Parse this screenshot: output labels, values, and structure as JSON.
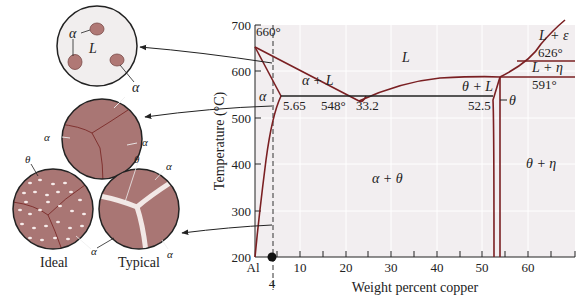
{
  "figure": {
    "y_axis_label": "Temperature (°C)",
    "x_axis_label": "Weight percent copper",
    "x_ticks": [
      "Al",
      "10",
      "20",
      "30",
      "40",
      "50",
      "60"
    ],
    "y_ticks": [
      "700",
      "600",
      "500",
      "400",
      "300",
      "200"
    ],
    "marker_label": "4",
    "annotations": {
      "melt_al": "660°",
      "eutectic_temp": "548°",
      "alpha_solubility": "5.65",
      "eutectic_comp": "33.2",
      "theta_comp": "52.5",
      "peritectic_1": "626°",
      "peritectic_2": "591°"
    },
    "phase_labels": {
      "liquid": "L",
      "alpha_plus_liquid": "α + L",
      "alpha": "α",
      "alpha_plus_theta": "α + θ",
      "theta_plus_liquid": "θ + L",
      "theta": "θ",
      "theta_plus_eta": "θ + η",
      "liquid_plus_epsilon": "L + ε",
      "liquid_plus_eta": "L + η"
    },
    "micrographs": {
      "liquid_stage": {
        "labels": [
          "α",
          "L",
          "α"
        ]
      },
      "alpha_stage": {
        "labels": [
          "α",
          "α",
          "α"
        ]
      },
      "ideal": {
        "caption": "Ideal",
        "labels": [
          "θ",
          "α"
        ]
      },
      "typical": {
        "caption": "Typical",
        "labels": [
          "θ",
          "α",
          "α",
          "α"
        ]
      }
    }
  },
  "colors": {
    "phase_line": "#7a1f22",
    "plot_bg": "#f2eef0",
    "grain": "#a97674",
    "grain_dark": "#8a4f4d",
    "precipitate": "#f6ecea",
    "line": "#222222"
  }
}
